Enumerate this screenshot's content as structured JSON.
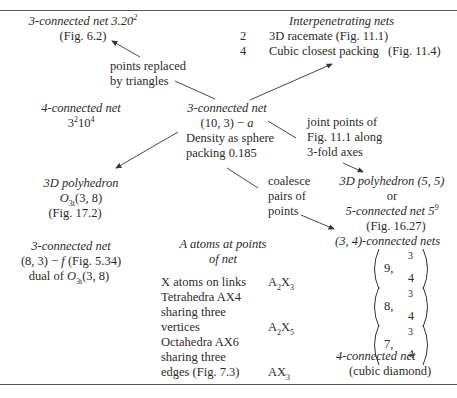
{
  "top_left": {
    "title": "3-connected net 3.20",
    "title_sup": "2",
    "fig": "(Fig. 6.2)"
  },
  "replaced_label": [
    "points replaced",
    "by triangles"
  ],
  "interpenetrating": {
    "title": "Interpenetrating nets",
    "rows": [
      {
        "n": "2",
        "text": "3D racemate (Fig. 11.1)"
      },
      {
        "n": "4",
        "text": "Cubic closest packing   (Fig. 11.4)"
      }
    ]
  },
  "four_conn": {
    "title": "4-connected net",
    "symbol_a": "3",
    "symbol_a_sup": "2",
    "symbol_b": "10",
    "symbol_b_sup": "4"
  },
  "center": {
    "title": "3-connected net",
    "line2": "(10, 3) − ",
    "line2_italic": "a",
    "line3": "Density as sphere",
    "line4": "packing 0.185"
  },
  "joint_label": [
    "joint points of",
    "Fig. 11.1 along",
    "3-fold axes"
  ],
  "polyhedron_left": {
    "title": "3D polyhedron",
    "symbol": "O",
    "symbol_sub": "3t",
    "symbol_rest": "(3, 8)",
    "fig": "(Fig. 17.2)"
  },
  "polyhedron_right": {
    "title": "3D polyhedron",
    "args": " (5, 5)",
    "or": "or",
    "alt": "5-connected net 5",
    "alt_sup": "9",
    "fig": "(Fig. 16.27)"
  },
  "coalesce_label": [
    "coalesce",
    "pairs of",
    "points"
  ],
  "eight_three": {
    "title": "3-connected net",
    "line2": "(8, 3) − ",
    "line2_italic": "f",
    "line2_fig": " (Fig. 5.34)",
    "line3": "dual of ",
    "symbol": "O",
    "symbol_sub": "3t",
    "symbol_rest": "(3, 8)"
  },
  "a_atoms": {
    "title": [
      "A atoms at points",
      "of net"
    ],
    "rows": [
      {
        "desc": [
          "X atoms on links"
        ],
        "formula": "A2X3"
      },
      {
        "desc": [
          "Tetrahedra AX4",
          "sharing three",
          "vertices"
        ],
        "formula": "A2X5"
      },
      {
        "desc": [
          "Octahedra AX6",
          "sharing three",
          "edges (Fig. 7.3)"
        ],
        "formula": "AX3"
      }
    ]
  },
  "three_four": {
    "title": "(3, 4)-connected nets",
    "matrices": [
      {
        "n": "9,",
        "top": "3",
        "bot": "4"
      },
      {
        "n": "8,",
        "top": "3",
        "bot": "4"
      },
      {
        "n": "7,",
        "top": "3",
        "bot": "4"
      }
    ],
    "four_conn": "4-connected net",
    "diamond": "(cubic diamond)"
  }
}
